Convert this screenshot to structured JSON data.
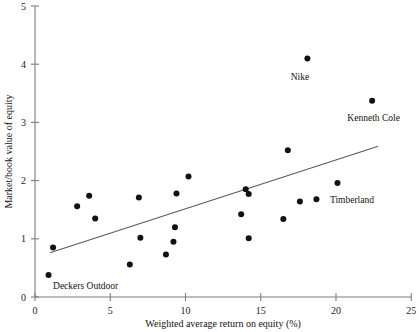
{
  "chart_data": {
    "type": "scatter",
    "title": "",
    "xlabel": "Weighted average return on equity (%)",
    "ylabel": "Market/book value of equity",
    "xlim": [
      0,
      25
    ],
    "ylim": [
      0,
      5
    ],
    "xticks": [
      0,
      5,
      10,
      15,
      20,
      25
    ],
    "yticks": [
      0,
      1,
      2,
      3,
      4,
      5
    ],
    "xtick_labels": [
      "0",
      "5",
      "10",
      "15",
      "20",
      "25"
    ],
    "ytick_labels": [
      "0",
      "1",
      "2",
      "3",
      "4",
      "5"
    ],
    "grid": false,
    "legend": "none",
    "marker_color": "#111111",
    "trendline_color": "#5a5a5a",
    "axis_color": "#7d7d7d",
    "points": [
      {
        "x": 0.9,
        "y": 0.38,
        "label": "Deckers Outdoor"
      },
      {
        "x": 1.2,
        "y": 0.85,
        "label": ""
      },
      {
        "x": 2.8,
        "y": 1.56,
        "label": ""
      },
      {
        "x": 3.6,
        "y": 1.74,
        "label": ""
      },
      {
        "x": 4.0,
        "y": 1.35,
        "label": ""
      },
      {
        "x": 6.3,
        "y": 0.56,
        "label": ""
      },
      {
        "x": 6.9,
        "y": 1.71,
        "label": ""
      },
      {
        "x": 7.0,
        "y": 1.02,
        "label": ""
      },
      {
        "x": 8.7,
        "y": 0.73,
        "label": ""
      },
      {
        "x": 9.2,
        "y": 0.95,
        "label": ""
      },
      {
        "x": 9.3,
        "y": 1.2,
        "label": ""
      },
      {
        "x": 9.4,
        "y": 1.78,
        "label": ""
      },
      {
        "x": 10.2,
        "y": 2.07,
        "label": ""
      },
      {
        "x": 13.7,
        "y": 1.42,
        "label": ""
      },
      {
        "x": 14.0,
        "y": 1.85,
        "label": ""
      },
      {
        "x": 14.2,
        "y": 1.77,
        "label": ""
      },
      {
        "x": 14.2,
        "y": 1.01,
        "label": ""
      },
      {
        "x": 16.5,
        "y": 1.34,
        "label": ""
      },
      {
        "x": 16.8,
        "y": 2.52,
        "label": ""
      },
      {
        "x": 17.6,
        "y": 1.64,
        "label": ""
      },
      {
        "x": 18.1,
        "y": 4.1,
        "label": "Nike"
      },
      {
        "x": 18.7,
        "y": 1.68,
        "label": "Timberland"
      },
      {
        "x": 20.1,
        "y": 1.96,
        "label": ""
      },
      {
        "x": 22.4,
        "y": 3.37,
        "label": "Kenneth Cole"
      }
    ],
    "trendline": {
      "x1": 1.0,
      "y1": 0.76,
      "x2": 22.8,
      "y2": 2.59
    },
    "annotations": [
      {
        "text": "Nike",
        "x": 17.6,
        "y": 3.72,
        "anchor": "middle"
      },
      {
        "text": "Kenneth Cole",
        "x": 22.5,
        "y": 3.02,
        "anchor": "middle"
      },
      {
        "text": "Timberland",
        "x": 19.6,
        "y": 1.62,
        "anchor": "start"
      },
      {
        "text": "Deckers Outdoor",
        "x": 1.2,
        "y": 0.14,
        "anchor": "start"
      }
    ]
  }
}
